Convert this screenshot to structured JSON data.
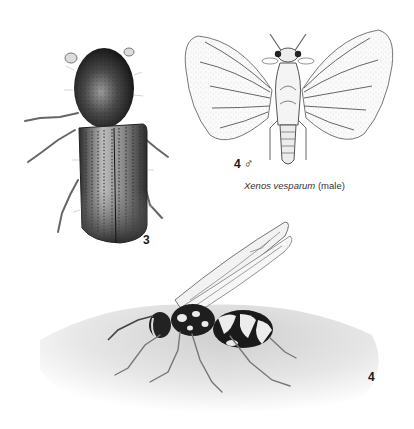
{
  "figure": {
    "beetle": {
      "label": "3"
    },
    "xenos": {
      "label": "4",
      "sex_symbol": "♂",
      "caption_species": "Xenos vesparum",
      "caption_note": "(male)"
    },
    "wasp": {
      "label": "4"
    }
  },
  "colors": {
    "background": "#ffffff",
    "ink": "#1a1a1a",
    "wing_line": "#555555"
  }
}
